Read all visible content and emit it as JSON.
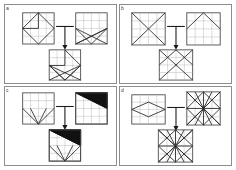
{
  "page": {
    "background_color": "#ffffff",
    "panel_border_color": "#8d8d8d",
    "grid_line_color": "#a8a8a8",
    "figure_frame_color": "#4a4a4a",
    "shape_stroke_color": "#2b2b2b",
    "shape_fill_color": "#111111",
    "connector_color": "#1a1a1a",
    "layout": "2x2 panel grid",
    "panel_count": 4
  },
  "panels": [
    {
      "id": "panel-a",
      "label": "a",
      "position": "top-left",
      "grid_size": "4x4",
      "operator": "overlay-combine",
      "connector": "T-shaped junction with downward arrow",
      "operands": [
        {
          "name": "operand-left",
          "description": "Square grid with large right-pointing arrow / chevron polygon",
          "fill": "none"
        },
        {
          "name": "operand-right",
          "description": "Square grid with X diagonals crossing the lower half and a full diagonal cross",
          "fill": "none"
        }
      ],
      "result": {
        "name": "result-figure",
        "description": "Square grid combining the chevron polygon with the lower fan of diagonals",
        "fill": "none"
      }
    },
    {
      "id": "panel-b",
      "label": "b",
      "position": "top-right",
      "grid_size": "4x4",
      "operator": "overlay-combine",
      "connector": "T-shaped junction with downward arrow",
      "operands": [
        {
          "name": "operand-left",
          "description": "Square grid with a single large X of corner-to-corner diagonals",
          "fill": "none"
        },
        {
          "name": "operand-right",
          "description": "Square grid with an inverted-V triangle peak rising from the base corners",
          "fill": "none"
        }
      ],
      "result": {
        "name": "result-figure",
        "description": "Square grid with the X diagonals plus the triangular peak overlaid",
        "fill": "none"
      }
    },
    {
      "id": "panel-c",
      "label": "c",
      "position": "bottom-left",
      "grid_size": "4x4",
      "operator": "overlay-combine",
      "connector": "T-shaped junction with downward arrow",
      "operands": [
        {
          "name": "operand-left",
          "description": "Square grid with a V shape descending to the bottom centre",
          "fill": "none"
        },
        {
          "name": "operand-right",
          "description": "Square grid with a solid black right triangle filling the upper band",
          "fill": "#111111"
        }
      ],
      "result": {
        "name": "result-figure",
        "description": "Square grid with the solid black upper triangle plus the V shape below it",
        "fill": "#111111"
      }
    },
    {
      "id": "panel-d",
      "label": "d",
      "position": "bottom-right",
      "grid_size": "4x4",
      "operator": "overlay-combine",
      "connector": "T-shaped junction with downward arrow",
      "operands": [
        {
          "name": "operand-left",
          "description": "Square grid with a wide horizontal rhombus / diamond outline",
          "fill": "none"
        },
        {
          "name": "operand-right",
          "description": "Square grid densely filled with a radiating star of many diagonals",
          "fill": "none"
        }
      ],
      "result": {
        "name": "result-figure",
        "description": "Square grid with the dense radiating star pattern combined with the diamond",
        "fill": "none"
      }
    }
  ]
}
